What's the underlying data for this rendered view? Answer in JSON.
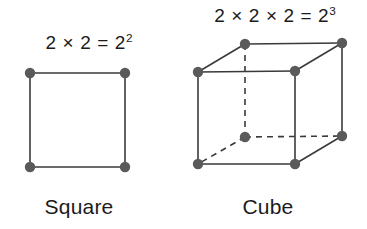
{
  "figure": {
    "background_color": "#ffffff",
    "stroke_color": "#3a3a3a",
    "vertex_color": "#5a5a5a",
    "text_color": "#1b1b1b"
  },
  "panels": [
    {
      "id": "square",
      "caption": "Square",
      "formula_text": "2 × 2 = 2",
      "formula_exponent": "2",
      "formula_full": "2 × 2 = 2²",
      "shape": "square",
      "vertex_count": 4,
      "edge_count": 4,
      "base": 2,
      "dimension": 2,
      "value": 4
    },
    {
      "id": "cube",
      "caption": "Cube",
      "formula_text": "2 × 2 × 2 = 2",
      "formula_exponent": "3",
      "formula_full": "2 × 2 × 2 = 2³",
      "shape": "cube",
      "vertex_count": 8,
      "edge_count": 12,
      "hidden_edge_count": 3,
      "base": 2,
      "dimension": 3,
      "value": 8
    }
  ]
}
